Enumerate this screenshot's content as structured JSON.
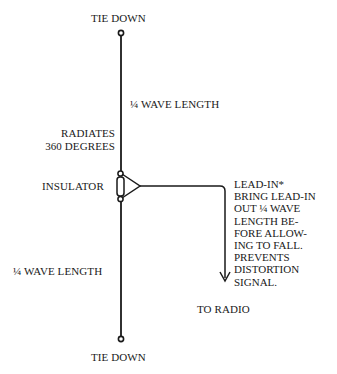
{
  "diagram": {
    "type": "dipole antenna",
    "labels": {
      "tie_down_top": "TIE DOWN",
      "quarter_wave_top": "¼ WAVE LENGTH",
      "radiates_line1": "RADIATES",
      "radiates_line2": "360 DEGREES",
      "insulator": "INSULATOR",
      "quarter_wave_bottom": "¼ WAVE LENGTH",
      "to_radio": "TO RADIO",
      "tie_down_bottom": "TIE DOWN"
    },
    "lead_in_note": [
      "LEAD-IN*",
      "BRING LEAD-IN",
      "OUT ¼ WAVE",
      "LENGTH BE-",
      "FORE ALLOW-",
      "ING TO FALL.",
      "PREVENTS",
      "DISTORTION",
      "SIGNAL."
    ],
    "colors": {
      "ink": "#1a1a1a",
      "background": "#ffffff"
    }
  }
}
